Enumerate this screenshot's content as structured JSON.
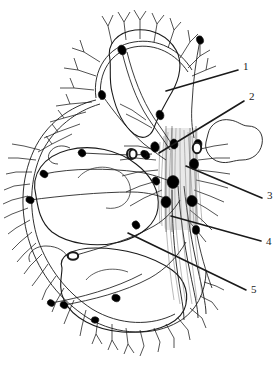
{
  "figure": {
    "background_color": "#ffffff",
    "line_color": "#1a1a1a",
    "node_fill_color": "#000000",
    "open_node_fill_color": "#ffffff"
  },
  "labels": [
    {
      "id": "1",
      "text": "1",
      "x": 243,
      "y": 67,
      "leader": {
        "x1": 238,
        "y1": 70,
        "x2": 166,
        "y2": 91
      }
    },
    {
      "id": "2",
      "text": "2",
      "x": 249,
      "y": 97,
      "leader": {
        "x1": 244,
        "y1": 101,
        "x2": 159,
        "y2": 153
      }
    },
    {
      "id": "3",
      "text": "3",
      "x": 267,
      "y": 196,
      "leader": {
        "x1": 262,
        "y1": 198,
        "x2": 186,
        "y2": 166
      }
    },
    {
      "id": "4",
      "text": "4",
      "x": 266,
      "y": 242,
      "leader": {
        "x1": 261,
        "y1": 241,
        "x2": 171,
        "y2": 216
      }
    },
    {
      "id": "5",
      "text": "5",
      "x": 251,
      "y": 290,
      "leader": {
        "x1": 246,
        "y1": 290,
        "x2": 128,
        "y2": 233
      }
    }
  ],
  "nodes": {
    "filled": [
      {
        "cx": 122,
        "cy": 50,
        "rx": 4.0,
        "ry": 5.0,
        "rot": -25
      },
      {
        "cx": 102,
        "cy": 95,
        "rx": 3.6,
        "ry": 4.6,
        "rot": -15
      },
      {
        "cx": 160,
        "cy": 115,
        "rx": 3.8,
        "ry": 4.8,
        "rot": -20
      },
      {
        "cx": 155,
        "cy": 147,
        "rx": 4.2,
        "ry": 5.2,
        "rot": -10
      },
      {
        "cx": 174,
        "cy": 144,
        "rx": 4.0,
        "ry": 5.0,
        "rot": -5
      },
      {
        "cx": 173,
        "cy": 182,
        "rx": 6.0,
        "ry": 6.4,
        "rot": 0
      },
      {
        "cx": 166,
        "cy": 202,
        "rx": 5.0,
        "ry": 5.8,
        "rot": 0
      },
      {
        "cx": 194,
        "cy": 164,
        "rx": 4.6,
        "ry": 5.4,
        "rot": 0
      },
      {
        "cx": 192,
        "cy": 201,
        "rx": 5.2,
        "ry": 5.6,
        "rot": -15
      },
      {
        "cx": 198,
        "cy": 144,
        "rx": 4.0,
        "ry": 4.6,
        "rot": 0
      },
      {
        "cx": 156,
        "cy": 181,
        "rx": 3.4,
        "ry": 4.2,
        "rot": -30
      },
      {
        "cx": 146,
        "cy": 155,
        "rx": 3.4,
        "ry": 4.4,
        "rot": -25
      },
      {
        "cx": 144,
        "cy": 154,
        "rx": 3.0,
        "ry": 3.8,
        "rot": -20
      },
      {
        "cx": 196,
        "cy": 230,
        "rx": 3.6,
        "ry": 4.4,
        "rot": 0
      },
      {
        "cx": 82,
        "cy": 153,
        "rx": 3.6,
        "ry": 4.0,
        "rot": -40
      },
      {
        "cx": 44,
        "cy": 174,
        "rx": 3.4,
        "ry": 4.2,
        "rot": -55
      },
      {
        "cx": 30,
        "cy": 200,
        "rx": 3.4,
        "ry": 4.2,
        "rot": -70
      },
      {
        "cx": 136,
        "cy": 225,
        "rx": 3.6,
        "ry": 4.2,
        "rot": -35
      },
      {
        "cx": 116,
        "cy": 298,
        "rx": 3.6,
        "ry": 4.2,
        "rot": -70
      },
      {
        "cx": 64,
        "cy": 305,
        "rx": 3.4,
        "ry": 4.0,
        "rot": -65
      },
      {
        "cx": 51,
        "cy": 303,
        "rx": 3.2,
        "ry": 3.8,
        "rot": -60
      },
      {
        "cx": 95,
        "cy": 320,
        "rx": 3.2,
        "ry": 3.8,
        "rot": -80
      },
      {
        "cx": 200,
        "cy": 40,
        "rx": 3.4,
        "ry": 4.2,
        "rot": -20
      }
    ],
    "open": [
      {
        "cx": 131,
        "cy": 154,
        "rx": 4.0,
        "ry": 5.0,
        "rot": 0
      },
      {
        "cx": 197,
        "cy": 148,
        "rx": 4.2,
        "ry": 5.2,
        "rot": 0
      },
      {
        "cx": 73,
        "cy": 256,
        "rx": 5.2,
        "ry": 3.8,
        "rot": 0
      },
      {
        "cx": 133,
        "cy": 154,
        "rx": 3.6,
        "ry": 4.6,
        "rot": 0
      }
    ]
  },
  "watermark": {
    "text": "",
    "visible": true,
    "x": 70,
    "y": 352
  }
}
